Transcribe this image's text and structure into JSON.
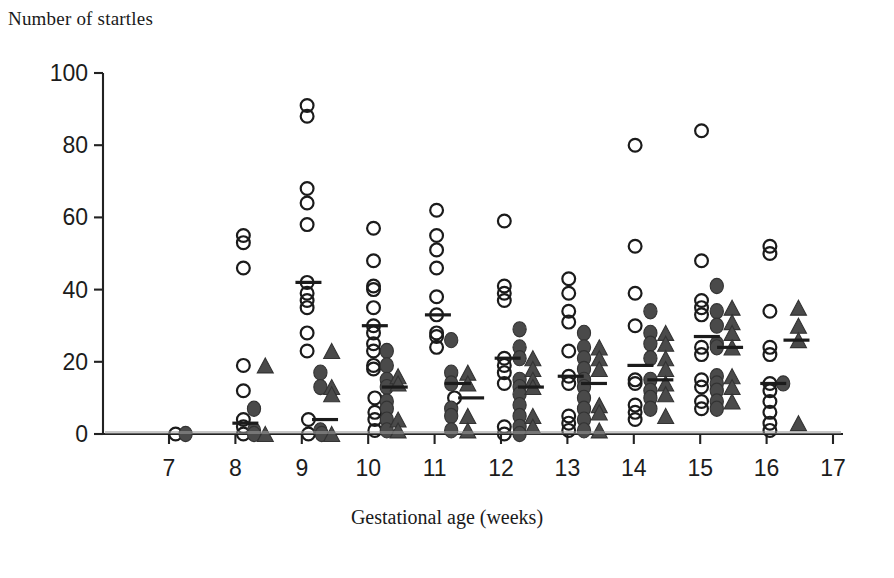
{
  "chart_data": {
    "type": "scatter",
    "title": "",
    "subtitle": "",
    "xlabel": "Gestational age (weeks)",
    "ylabel": "Number of startles",
    "xlim": [
      7,
      17
    ],
    "ylim": [
      0,
      100
    ],
    "xticks": [
      7,
      8,
      9,
      10,
      11,
      12,
      13,
      14,
      15,
      16,
      17
    ],
    "yticks": [
      0,
      20,
      40,
      60,
      80,
      100
    ],
    "grid": false,
    "legend_position": "none",
    "legend": [
      {
        "name": "open-circle-series",
        "marker": "open-circle"
      },
      {
        "name": "filled-circle-series",
        "marker": "filled-circle"
      },
      {
        "name": "filled-triangle-series",
        "marker": "filled-triangle"
      }
    ],
    "annotations": [
      {
        "kind": "median-bar",
        "x": 8.15,
        "y": 3
      },
      {
        "kind": "median-bar",
        "x": 9.1,
        "y": 42
      },
      {
        "kind": "median-bar",
        "x": 9.35,
        "y": 4
      },
      {
        "kind": "median-bar",
        "x": 10.1,
        "y": 30
      },
      {
        "kind": "median-bar",
        "x": 10.4,
        "y": 13
      },
      {
        "kind": "median-bar",
        "x": 11.05,
        "y": 33
      },
      {
        "kind": "median-bar",
        "x": 11.35,
        "y": 14
      },
      {
        "kind": "median-bar",
        "x": 11.55,
        "y": 10
      },
      {
        "kind": "median-bar",
        "x": 12.1,
        "y": 21
      },
      {
        "kind": "median-bar",
        "x": 12.45,
        "y": 13
      },
      {
        "kind": "median-bar",
        "x": 13.05,
        "y": 16
      },
      {
        "kind": "median-bar",
        "x": 13.4,
        "y": 14
      },
      {
        "kind": "median-bar",
        "x": 14.1,
        "y": 19
      },
      {
        "kind": "median-bar",
        "x": 14.4,
        "y": 15
      },
      {
        "kind": "median-bar",
        "x": 15.1,
        "y": 27
      },
      {
        "kind": "median-bar",
        "x": 15.45,
        "y": 24
      },
      {
        "kind": "median-bar",
        "x": 16.45,
        "y": 26
      },
      {
        "kind": "median-bar",
        "x": 16.1,
        "y": 14
      }
    ],
    "series": [
      {
        "name": "open-circle-series",
        "marker": "open-circle",
        "points": [
          [
            7.1,
            0
          ],
          [
            8.12,
            55
          ],
          [
            8.12,
            53
          ],
          [
            8.12,
            46
          ],
          [
            8.12,
            19
          ],
          [
            8.12,
            12
          ],
          [
            8.12,
            4
          ],
          [
            8.12,
            2
          ],
          [
            8.12,
            0
          ],
          [
            9.08,
            91
          ],
          [
            9.08,
            88
          ],
          [
            9.08,
            68
          ],
          [
            9.08,
            64
          ],
          [
            9.08,
            58
          ],
          [
            9.08,
            42
          ],
          [
            9.08,
            39
          ],
          [
            9.08,
            37
          ],
          [
            9.08,
            35
          ],
          [
            9.08,
            28
          ],
          [
            9.08,
            23
          ],
          [
            9.1,
            4
          ],
          [
            9.1,
            0
          ],
          [
            10.08,
            57
          ],
          [
            10.08,
            48
          ],
          [
            10.08,
            41
          ],
          [
            10.08,
            40
          ],
          [
            10.08,
            35
          ],
          [
            10.08,
            30
          ],
          [
            10.08,
            28
          ],
          [
            10.08,
            25
          ],
          [
            10.08,
            23
          ],
          [
            10.08,
            19
          ],
          [
            10.08,
            18
          ],
          [
            10.1,
            10
          ],
          [
            10.1,
            6
          ],
          [
            10.1,
            4
          ],
          [
            10.1,
            1
          ],
          [
            11.03,
            62
          ],
          [
            11.03,
            55
          ],
          [
            11.03,
            51
          ],
          [
            11.03,
            46
          ],
          [
            11.03,
            38
          ],
          [
            11.03,
            33
          ],
          [
            11.03,
            28
          ],
          [
            11.03,
            27
          ],
          [
            11.03,
            24
          ],
          [
            11.3,
            10
          ],
          [
            12.05,
            59
          ],
          [
            12.05,
            41
          ],
          [
            12.05,
            39
          ],
          [
            12.05,
            37
          ],
          [
            12.05,
            21
          ],
          [
            12.05,
            19
          ],
          [
            12.05,
            17
          ],
          [
            12.05,
            14
          ],
          [
            12.05,
            2
          ],
          [
            12.05,
            0
          ],
          [
            13.02,
            43
          ],
          [
            13.02,
            39
          ],
          [
            13.02,
            34
          ],
          [
            13.02,
            31
          ],
          [
            13.02,
            23
          ],
          [
            13.02,
            16
          ],
          [
            13.02,
            14
          ],
          [
            13.02,
            5
          ],
          [
            13.02,
            3
          ],
          [
            13.02,
            1
          ],
          [
            14.02,
            80
          ],
          [
            14.02,
            52
          ],
          [
            14.02,
            39
          ],
          [
            14.02,
            30
          ],
          [
            14.02,
            15
          ],
          [
            14.02,
            14
          ],
          [
            14.02,
            8
          ],
          [
            14.02,
            6
          ],
          [
            14.02,
            4
          ],
          [
            15.02,
            84
          ],
          [
            15.02,
            48
          ],
          [
            15.02,
            37
          ],
          [
            15.02,
            35
          ],
          [
            15.02,
            33
          ],
          [
            15.02,
            24
          ],
          [
            15.02,
            22
          ],
          [
            15.02,
            15
          ],
          [
            15.02,
            13
          ],
          [
            15.02,
            9
          ],
          [
            15.02,
            7
          ],
          [
            16.05,
            52
          ],
          [
            16.05,
            50
          ],
          [
            16.05,
            34
          ],
          [
            16.05,
            24
          ],
          [
            16.05,
            22
          ],
          [
            16.05,
            14
          ],
          [
            16.05,
            12
          ],
          [
            16.05,
            9
          ],
          [
            16.05,
            6
          ],
          [
            16.05,
            3
          ],
          [
            16.05,
            1
          ]
        ]
      },
      {
        "name": "filled-circle-series",
        "marker": "filled-circle",
        "points": [
          [
            7.25,
            0
          ],
          [
            8.28,
            7
          ],
          [
            8.28,
            1
          ],
          [
            8.28,
            0
          ],
          [
            9.28,
            17
          ],
          [
            9.28,
            13
          ],
          [
            9.28,
            1
          ],
          [
            9.3,
            0
          ],
          [
            10.28,
            23
          ],
          [
            10.28,
            19
          ],
          [
            10.28,
            15
          ],
          [
            10.28,
            13
          ],
          [
            10.28,
            9
          ],
          [
            10.28,
            7
          ],
          [
            10.28,
            4
          ],
          [
            10.28,
            1
          ],
          [
            11.25,
            26
          ],
          [
            11.25,
            17
          ],
          [
            11.25,
            14
          ],
          [
            11.25,
            7
          ],
          [
            11.25,
            5
          ],
          [
            11.25,
            1
          ],
          [
            12.28,
            29
          ],
          [
            12.28,
            24
          ],
          [
            12.28,
            21
          ],
          [
            12.28,
            15
          ],
          [
            12.28,
            13
          ],
          [
            12.28,
            11
          ],
          [
            12.28,
            8
          ],
          [
            12.28,
            5
          ],
          [
            12.28,
            2
          ],
          [
            12.28,
            0
          ],
          [
            13.25,
            28
          ],
          [
            13.25,
            24
          ],
          [
            13.25,
            21
          ],
          [
            13.25,
            18
          ],
          [
            13.25,
            15
          ],
          [
            13.25,
            13
          ],
          [
            13.25,
            10
          ],
          [
            13.25,
            7
          ],
          [
            13.25,
            4
          ],
          [
            13.25,
            1
          ],
          [
            14.25,
            34
          ],
          [
            14.25,
            28
          ],
          [
            14.25,
            25
          ],
          [
            14.25,
            21
          ],
          [
            14.25,
            15
          ],
          [
            14.25,
            12
          ],
          [
            14.25,
            10
          ],
          [
            14.25,
            7
          ],
          [
            15.25,
            41
          ],
          [
            15.25,
            34
          ],
          [
            15.25,
            30
          ],
          [
            15.25,
            25
          ],
          [
            15.25,
            24
          ],
          [
            15.25,
            16
          ],
          [
            15.25,
            14
          ],
          [
            15.25,
            12
          ],
          [
            15.25,
            9
          ],
          [
            15.25,
            7
          ],
          [
            16.25,
            14
          ]
        ]
      },
      {
        "name": "filled-triangle-series",
        "marker": "filled-triangle",
        "points": [
          [
            8.45,
            19
          ],
          [
            8.45,
            0
          ],
          [
            9.45,
            23
          ],
          [
            9.45,
            13
          ],
          [
            9.45,
            11
          ],
          [
            9.45,
            0
          ],
          [
            10.45,
            16
          ],
          [
            10.45,
            14
          ],
          [
            10.45,
            4
          ],
          [
            10.45,
            1
          ],
          [
            11.5,
            17
          ],
          [
            11.5,
            14
          ],
          [
            11.5,
            5
          ],
          [
            11.5,
            1
          ],
          [
            12.48,
            21
          ],
          [
            12.48,
            18
          ],
          [
            12.48,
            15
          ],
          [
            12.48,
            13
          ],
          [
            12.48,
            5
          ],
          [
            12.48,
            2
          ],
          [
            13.48,
            24
          ],
          [
            13.48,
            21
          ],
          [
            13.48,
            18
          ],
          [
            13.48,
            8
          ],
          [
            13.48,
            6
          ],
          [
            13.48,
            1
          ],
          [
            14.48,
            28
          ],
          [
            14.48,
            25
          ],
          [
            14.48,
            21
          ],
          [
            14.48,
            18
          ],
          [
            14.48,
            14
          ],
          [
            14.48,
            11
          ],
          [
            14.48,
            5
          ],
          [
            15.48,
            35
          ],
          [
            15.48,
            31
          ],
          [
            15.48,
            28
          ],
          [
            15.48,
            24
          ],
          [
            15.48,
            16
          ],
          [
            15.48,
            13
          ],
          [
            15.48,
            9
          ],
          [
            16.48,
            35
          ],
          [
            16.48,
            30
          ],
          [
            16.48,
            26
          ],
          [
            16.48,
            3
          ]
        ]
      }
    ]
  },
  "axes": {
    "x_tick_labels": [
      "7",
      "8",
      "9",
      "10",
      "11",
      "12",
      "13",
      "14",
      "15",
      "16",
      "17"
    ],
    "y_tick_labels": [
      "0",
      "20",
      "40",
      "60",
      "80",
      "100"
    ],
    "x_axis_title": "Gestational age (weeks)",
    "y_axis_title": "Number of startles"
  },
  "geometry": {
    "plot_left": 103,
    "plot_right": 843,
    "plot_bottom": 434,
    "plot_top": 73,
    "x_min": 7,
    "x_max": 17,
    "y_min": 0,
    "y_max": 100,
    "x7_px": 169,
    "x17_px": 833
  }
}
